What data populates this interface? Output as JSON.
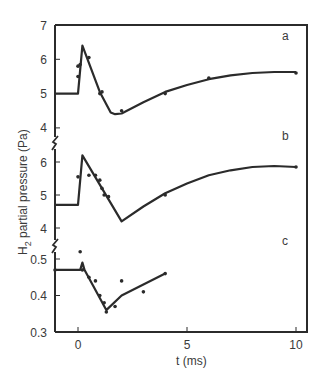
{
  "chart_data": {
    "type": "line",
    "title": "",
    "xlabel": "t (ms)",
    "ylabel": "H2 partial pressure (Pa)",
    "ylabel_parts": {
      "pre": "H",
      "sub": "2",
      "post": " partial pressure (Pa)"
    },
    "xlim": [
      -1.5,
      10.5
    ],
    "x_ticks": [
      0,
      5,
      10
    ],
    "x_tick_labels": [
      "0",
      "5",
      "10"
    ],
    "grid": false,
    "legend": null,
    "panels": [
      {
        "label": "a",
        "ylim": [
          4,
          7
        ],
        "y_ticks": [
          4,
          5,
          6,
          7
        ],
        "y_tick_labels": [
          "4",
          "5",
          "6",
          "7"
        ],
        "fit_curve": {
          "x": [
            -1.5,
            0.0,
            0.0,
            0.2,
            1.0,
            1.5,
            1.7,
            2.0,
            3.0,
            4.0,
            5.0,
            6.0,
            7.0,
            8.0,
            9.0,
            10.0
          ],
          "y": [
            5.0,
            5.0,
            5.0,
            6.4,
            5.05,
            4.45,
            4.4,
            4.42,
            4.75,
            5.05,
            5.25,
            5.42,
            5.53,
            5.6,
            5.63,
            5.63
          ]
        },
        "measured_points": {
          "x": [
            0.0,
            0.0,
            0.1,
            0.5,
            1.0,
            1.1,
            2.0,
            4.0,
            6.0,
            10.0
          ],
          "y": [
            5.5,
            5.8,
            5.85,
            6.05,
            5.0,
            5.05,
            4.5,
            5.0,
            5.45,
            5.6
          ]
        }
      },
      {
        "label": "b",
        "ylim": [
          4,
          6
        ],
        "y_ticks": [
          4,
          5,
          6
        ],
        "y_tick_labels": [
          "4",
          "5",
          "6"
        ],
        "fit_curve": {
          "x": [
            -1.5,
            0.0,
            0.0,
            0.2,
            2.0,
            3.0,
            4.0,
            5.0,
            6.0,
            7.0,
            8.0,
            9.0,
            10.0
          ],
          "y": [
            4.7,
            4.7,
            4.7,
            6.2,
            4.2,
            4.65,
            5.05,
            5.35,
            5.6,
            5.75,
            5.85,
            5.88,
            5.85
          ]
        },
        "measured_points": {
          "x": [
            0.0,
            0.5,
            0.8,
            1.0,
            1.1,
            1.2,
            1.4,
            4.0,
            10.0
          ],
          "y": [
            5.55,
            5.6,
            5.6,
            5.45,
            5.2,
            5.0,
            4.95,
            5.0,
            5.85
          ]
        }
      },
      {
        "label": "c",
        "ylim": [
          0.3,
          0.55
        ],
        "y_ticks": [
          0.3,
          0.4,
          0.5
        ],
        "y_tick_labels": [
          "0.3",
          "0.4",
          "0.5"
        ],
        "fit_curve": {
          "x": [
            -1.5,
            0.0,
            0.1,
            0.2,
            0.3,
            0.25,
            1.3,
            2.0,
            3.0,
            4.0
          ],
          "y": [
            0.47,
            0.47,
            0.47,
            0.49,
            0.47,
            0.475,
            0.36,
            0.4,
            0.43,
            0.46
          ]
        },
        "measured_points": {
          "x": [
            -1.5,
            0.1,
            0.2,
            0.5,
            0.8,
            1.0,
            1.2,
            1.3,
            1.7,
            2.0,
            3.0,
            4.0
          ],
          "y": [
            0.47,
            0.52,
            0.47,
            0.45,
            0.44,
            0.4,
            0.38,
            0.355,
            0.37,
            0.44,
            0.41,
            0.46
          ]
        }
      }
    ]
  }
}
